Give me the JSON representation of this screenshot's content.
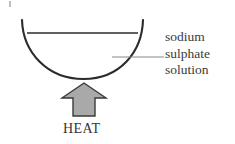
{
  "diagram": {
    "colors": {
      "stroke": "#2b2b2b",
      "leader_line": "#8a8a8a",
      "arrow_fill": "#a9a9a9",
      "arrow_stroke": "#3a3a3a",
      "text": "#3a3a3a",
      "background": "#ffffff"
    },
    "vessel": {
      "name": "round-bottom-flask",
      "rim_left_x": 22,
      "rim_right_x": 143,
      "rim_y": 20,
      "bottom_y": 79,
      "liquid_surface_y": 33,
      "liquid_left_x": 27,
      "liquid_right_x": 138
    },
    "leader": {
      "from_x": 112,
      "to_x": 164,
      "y": 57
    },
    "annotation": {
      "lines": [
        "sodium",
        "sulphate",
        "solution"
      ]
    },
    "heat": {
      "label": "HEAT",
      "arrow": {
        "name": "up-arrow",
        "apex_x": 84,
        "apex_y": 83,
        "head_left_x": 62,
        "head_right_x": 106,
        "shoulder_y": 98,
        "shaft_left_x": 73,
        "shaft_right_x": 95,
        "base_y": 116
      }
    }
  }
}
